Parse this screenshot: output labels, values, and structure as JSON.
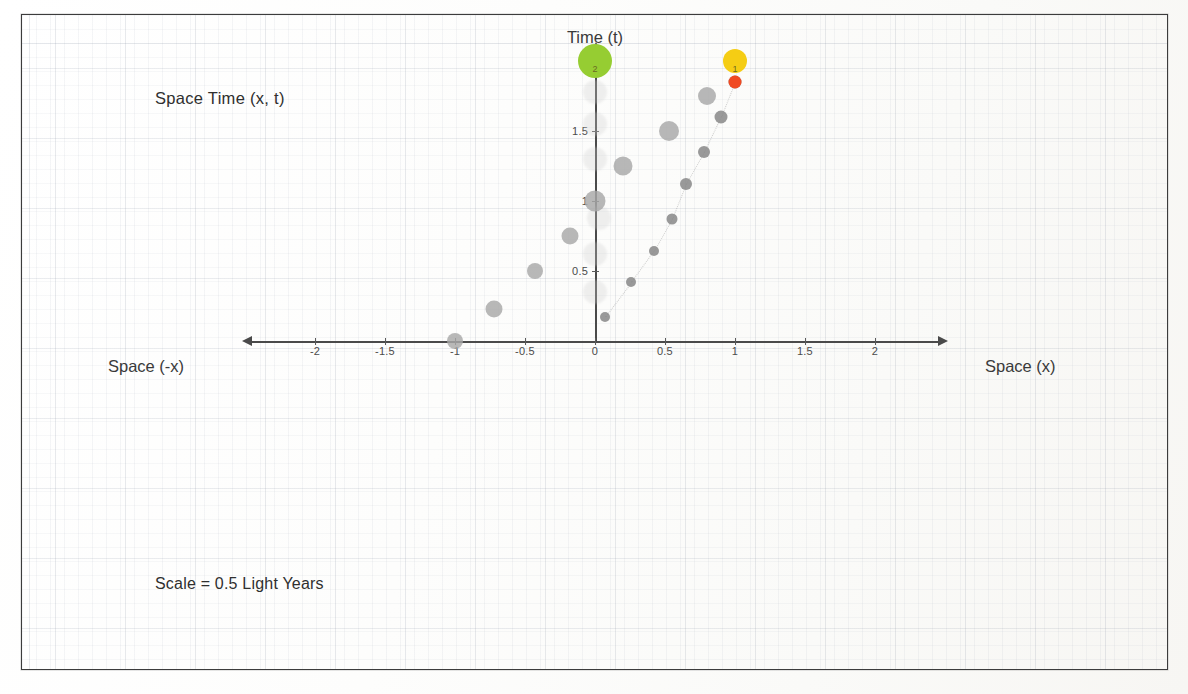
{
  "document": {
    "kind": "scanned-worksheet",
    "border_color": "#3c3c3c",
    "background": "#fcfcfb"
  },
  "labels": {
    "title": "Space  Time  (x, t)",
    "y_axis_name": "Time (t)",
    "x_axis_name_right": "Space (x)",
    "x_axis_name_left": "Space (-x)",
    "scale_note": "Scale = 0.5 Light Years"
  },
  "colors": {
    "axis": "#4a4a4a",
    "grid": "#c8ccd6",
    "marker_large_gray": "#a9a9a9",
    "marker_small_gray": "#8c8c8c",
    "marker_green": "#96cd32",
    "marker_yellow": "#f5cd14",
    "marker_red": "#f04a22",
    "text": "#2f2f2f"
  },
  "chart_data": {
    "type": "scatter",
    "title": "Space  Time  (x, t)",
    "xlabel": "Space (x)",
    "ylabel": "Time (t)",
    "xlim": [
      -2.35,
      2.35
    ],
    "ylim": [
      -0.6,
      2.2
    ],
    "grid": true,
    "legend": null,
    "annotations": [
      "Scale = 0.5 Light Years",
      "Space (-x)",
      "Space (x)"
    ],
    "xticks": [
      -2,
      -1.5,
      -1,
      -0.5,
      0,
      0.5,
      1,
      1.5,
      2
    ],
    "xticklabels": [
      "-2",
      "-1.5",
      "-1",
      "-0.5",
      "0",
      "0.5",
      "1",
      "1.5",
      "2"
    ],
    "yticks": [
      0.5,
      1,
      1.5,
      2
    ],
    "yticklabels": [
      "0.5",
      "1",
      "1.5",
      "2"
    ],
    "units": "light years",
    "scale_per_division": 0.5,
    "series": [
      {
        "name": "left-branch-large-gray",
        "marker": "circle",
        "color": "#a9a9a9",
        "size": "large",
        "points": [
          {
            "x": -1.0,
            "y": 0.0
          },
          {
            "x": -0.72,
            "y": 0.23
          },
          {
            "x": -0.43,
            "y": 0.5
          },
          {
            "x": -0.18,
            "y": 0.75
          },
          {
            "x": 0.0,
            "y": 1.0
          },
          {
            "x": 0.2,
            "y": 1.25
          },
          {
            "x": 0.53,
            "y": 1.5
          },
          {
            "x": 0.8,
            "y": 1.75
          }
        ]
      },
      {
        "name": "right-branch-small-gray",
        "marker": "circle",
        "color": "#8c8c8c",
        "size": "small",
        "points": [
          {
            "x": 0.07,
            "y": 0.17
          },
          {
            "x": 0.26,
            "y": 0.42
          },
          {
            "x": 0.42,
            "y": 0.64
          },
          {
            "x": 0.55,
            "y": 0.87
          },
          {
            "x": 0.65,
            "y": 1.12
          },
          {
            "x": 0.78,
            "y": 1.35
          },
          {
            "x": 0.9,
            "y": 1.6
          },
          {
            "x": 1.0,
            "y": 1.85
          }
        ]
      },
      {
        "name": "event-origin-observer",
        "marker": "circle",
        "color": "#96cd32",
        "size": "xlarge",
        "points": [
          {
            "x": 0.0,
            "y": 2.0,
            "label": "2"
          }
        ]
      },
      {
        "name": "event-traveler-arrival",
        "marker": "circle",
        "color": "#f5cd14",
        "size": "large",
        "points": [
          {
            "x": 1.0,
            "y": 2.0,
            "label": "1"
          }
        ]
      },
      {
        "name": "event-traveler-last",
        "marker": "circle",
        "color": "#f04a22",
        "size": "small",
        "points": [
          {
            "x": 1.0,
            "y": 1.85
          }
        ]
      }
    ]
  }
}
